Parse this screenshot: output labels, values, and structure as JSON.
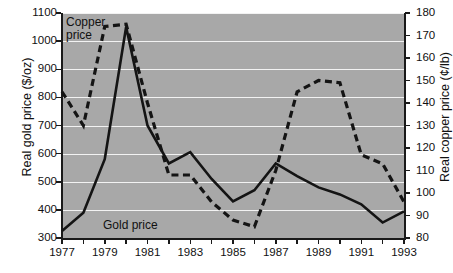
{
  "chart_data": {
    "type": "line",
    "title": "",
    "xlabel": "",
    "grid": true,
    "legend_position": "inline-annotations",
    "x": [
      1977,
      1978,
      1979,
      1980,
      1981,
      1982,
      1983,
      1984,
      1985,
      1986,
      1987,
      1988,
      1989,
      1990,
      1991,
      1992,
      1993
    ],
    "xlim": [
      1977,
      1993
    ],
    "xticks": [
      1977,
      1978,
      1979,
      1980,
      1981,
      1982,
      1983,
      1984,
      1985,
      1986,
      1987,
      1988,
      1989,
      1990,
      1991,
      1992,
      1993
    ],
    "xticklabels": [
      "1977",
      "",
      "1979",
      "",
      "1981",
      "",
      "1983",
      "",
      "1985",
      "",
      "1987",
      "",
      "1989",
      "",
      "1991",
      "",
      "1993"
    ],
    "axes": [
      {
        "id": "left",
        "label": "Real gold price ($/oz)",
        "unit": "$/oz",
        "lim": [
          300,
          1100
        ],
        "ticks": [
          300,
          400,
          500,
          600,
          700,
          800,
          900,
          1000,
          1100
        ],
        "ticklabels": [
          "300",
          "400",
          "500",
          "600",
          "700",
          "800",
          "900",
          "1000",
          "1100"
        ]
      },
      {
        "id": "right",
        "label": "Real copper price (¢/lb)",
        "unit": "¢/lb",
        "lim": [
          80,
          180
        ],
        "ticks": [
          80,
          90,
          100,
          110,
          120,
          130,
          140,
          150,
          160,
          170,
          180
        ],
        "ticklabels": [
          "80",
          "90",
          "100",
          "110",
          "120",
          "130",
          "140",
          "150",
          "160",
          "170",
          "180"
        ]
      }
    ],
    "series": [
      {
        "name": "Gold price",
        "axis": "left",
        "style": "solid",
        "color": "#141414",
        "annotation": "Gold price",
        "values": [
          325,
          390,
          580,
          1050,
          700,
          565,
          605,
          510,
          430,
          470,
          565,
          520,
          480,
          455,
          420,
          355,
          395
        ]
      },
      {
        "name": "Copper price",
        "axis": "right",
        "style": "dashed",
        "color": "#141414",
        "annotation": "Copper\nprice",
        "values": [
          145,
          130,
          174,
          175,
          140,
          108,
          108,
          96,
          88,
          85,
          110,
          145,
          150,
          149,
          117,
          113,
          96
        ]
      }
    ]
  },
  "figure": {
    "background": "#ffffff",
    "plot_background": "#a8a8a8",
    "gridline_color": "#f2f2f2",
    "axis_color": "#1a1a1a"
  }
}
